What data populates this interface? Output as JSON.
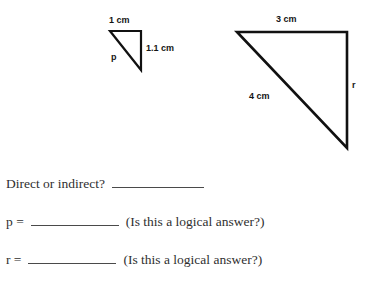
{
  "page": {
    "background_color": "#ffffff",
    "text_color": "#2f2f2f",
    "stroke_color": "#111111"
  },
  "figures": {
    "small_triangle": {
      "name": "small-right-triangle",
      "vertices": [
        [
          110,
          31
        ],
        [
          141,
          31
        ],
        [
          141,
          70
        ]
      ],
      "labels": {
        "top_side": "1 cm",
        "right_side": "1.1 cm",
        "hypotenuse": "p"
      }
    },
    "large_triangle": {
      "name": "large-right-triangle",
      "vertices": [
        [
          237,
          32
        ],
        [
          347,
          32
        ],
        [
          347,
          148
        ]
      ],
      "labels": {
        "top_side": "3 cm",
        "hypotenuse": "4 cm",
        "right_side": "r"
      }
    }
  },
  "questions": [
    {
      "prompt": "Direct or indirect?",
      "blank": "",
      "suffix": ""
    },
    {
      "prompt": "p =",
      "blank": "",
      "suffix": "(Is this a logical answer?)"
    },
    {
      "prompt": "r =",
      "blank": "",
      "suffix": "(Is this a logical answer?)"
    }
  ]
}
